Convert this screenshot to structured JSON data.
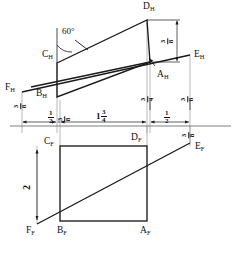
{
  "drawing": {
    "title": "Descriptive geometry: top view (H) and front view (F) of plane ABCD with line EF",
    "views": {
      "top": "H",
      "front": "F"
    },
    "colors": {
      "line": "#1a1a1a",
      "thin_line": "#555555",
      "background": "#ffffff"
    }
  },
  "labels": {
    "top_view": [
      {
        "id": "D_H",
        "letter": "D",
        "sub": "H",
        "x": 147,
        "y": 4
      },
      {
        "id": "C_H",
        "letter": "C",
        "sub": "H",
        "x": 47,
        "y": 52
      },
      {
        "id": "E_H",
        "letter": "E",
        "sub": "H",
        "x": 193,
        "y": 52
      },
      {
        "id": "A_H",
        "letter": "A",
        "sub": "H",
        "x": 160,
        "y": 69
      },
      {
        "id": "F_H",
        "letter": "F",
        "sub": "H",
        "x": 7,
        "y": 85
      },
      {
        "id": "B_H",
        "letter": "B",
        "sub": "H",
        "x": 39,
        "y": 90
      }
    ],
    "front_view": [
      {
        "id": "C_F",
        "letter": "C",
        "sub": "F",
        "x": 47,
        "y": 140
      },
      {
        "id": "D_F",
        "letter": "D",
        "sub": "F",
        "x": 133,
        "y": 135
      },
      {
        "id": "E_F",
        "letter": "E",
        "sub": "F",
        "x": 196,
        "y": 144
      },
      {
        "id": "F_F",
        "letter": "F",
        "sub": "F",
        "x": 26,
        "y": 228
      },
      {
        "id": "B_F",
        "letter": "B",
        "sub": "F",
        "x": 57,
        "y": 228
      },
      {
        "id": "A_F",
        "letter": "A",
        "sub": "F",
        "x": 142,
        "y": 228
      }
    ]
  },
  "annotations": {
    "angle": {
      "value": "60°",
      "x": 63,
      "y": 30
    }
  },
  "dimensions": [
    {
      "id": "dim-half-left",
      "text": "1/2",
      "whole": "",
      "num": "1",
      "den": "2",
      "x": 51,
      "y": 112,
      "rotated": false
    },
    {
      "id": "dim-38-left",
      "text": "3/8",
      "whole": "",
      "num": "3",
      "den": "8",
      "x": 66,
      "y": 113,
      "rotated": true
    },
    {
      "id": "dim-1-3-4",
      "text": "1 3/4",
      "whole": "1",
      "num": "3",
      "den": "4",
      "x": 100,
      "y": 111,
      "rotated": false
    },
    {
      "id": "dim-half-right",
      "text": "1/2",
      "whole": "",
      "num": "1",
      "den": "2",
      "x": 163,
      "y": 112,
      "rotated": false
    },
    {
      "id": "dim-38-fh",
      "text": "3/8",
      "whole": "",
      "num": "3",
      "den": "8",
      "x": 22,
      "y": 100,
      "rotated": true
    },
    {
      "id": "dim-38-top-right",
      "text": "3/8",
      "whole": "",
      "num": "3",
      "den": "8",
      "x": 167,
      "y": 34,
      "rotated": true
    },
    {
      "id": "dim-34-ah",
      "text": "3/4",
      "whole": "",
      "num": "3",
      "den": "4",
      "x": 149,
      "y": 93,
      "rotated": true
    },
    {
      "id": "dim-38-eh",
      "text": "3/8",
      "whole": "",
      "num": "3",
      "den": "8",
      "x": 178,
      "y": 92,
      "rotated": true
    },
    {
      "id": "dim-38-ef",
      "text": "3/8",
      "whole": "",
      "num": "3",
      "den": "8",
      "x": 181,
      "y": 128,
      "rotated": true
    }
  ],
  "height_dimension": {
    "id": "dim-2",
    "text": "2",
    "x": 27,
    "y": 186,
    "rotated": true
  },
  "geometry": {
    "top_view": {
      "C": [
        57,
        63
      ],
      "D": [
        147,
        20
      ],
      "A": [
        150,
        62
      ],
      "B": [
        57,
        97
      ],
      "E": [
        190,
        55
      ],
      "F": [
        22,
        92
      ]
    },
    "front_view": {
      "C": [
        60,
        146
      ],
      "D": [
        147,
        146
      ],
      "A": [
        147,
        221
      ],
      "B": [
        60,
        221
      ],
      "E": [
        190,
        143
      ],
      "F": [
        37,
        224
      ]
    },
    "reference_line": {
      "x1": 10,
      "y1": 126,
      "x2": 231,
      "y2": 126
    }
  }
}
